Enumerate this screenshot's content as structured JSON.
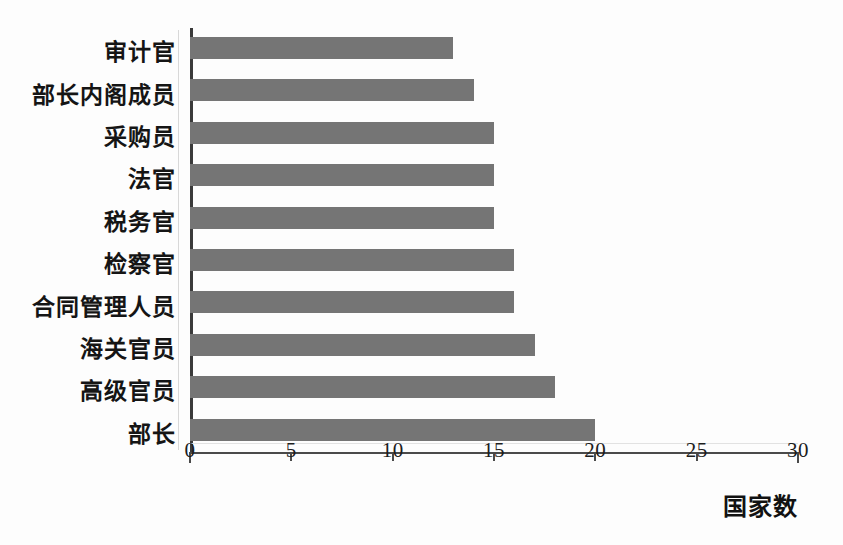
{
  "chart_data": {
    "type": "bar",
    "orientation": "horizontal",
    "title": "",
    "subtitle": "",
    "xlabel": "国家数",
    "ylabel": "",
    "categories": [
      "审计官",
      "部长内阁成员",
      "采购员",
      "法官",
      "税务官",
      "检察官",
      "合同管理人员",
      "海关官员",
      "高级官员",
      "部长"
    ],
    "values": [
      13,
      14,
      15,
      15,
      15,
      16,
      16,
      17,
      18,
      20
    ],
    "xlim": [
      0,
      30
    ],
    "xticks": [
      0,
      5,
      10,
      15,
      20,
      25,
      30
    ],
    "xtick_labels": [
      "0",
      "5",
      "10",
      "15",
      "20",
      "25",
      "30"
    ],
    "grid": false,
    "legend": false,
    "bar_color": "#757575",
    "axis_color": "#4a4a4a",
    "background_color": "#fdfdfd",
    "text_color": "#151515"
  }
}
